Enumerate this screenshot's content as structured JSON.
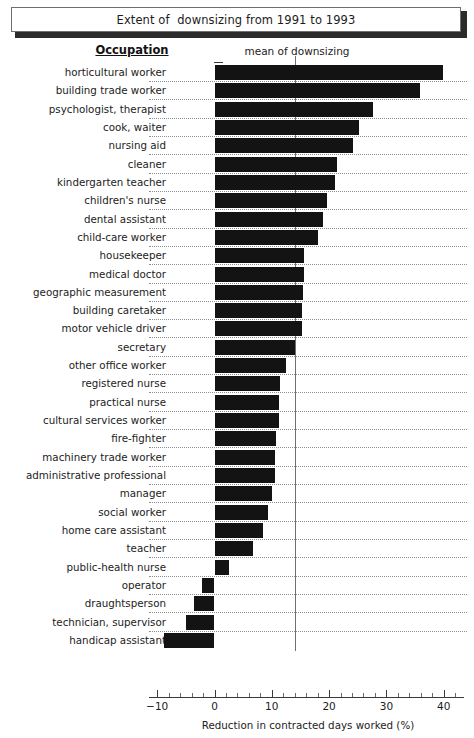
{
  "title": "Extent of  downsizing from 1991 to 1993",
  "headers": {
    "occupation": "Occupation",
    "mean_label": "mean of downsizing"
  },
  "axis": {
    "xlabel": "Reduction in contracted days worked (%)",
    "ticks": [
      "-10",
      "0",
      "10",
      "20",
      "30",
      "40"
    ],
    "tick_values": [
      -10,
      0,
      10,
      20,
      30,
      40
    ],
    "minor_step": 2,
    "xmin": -11.5,
    "xmax": 43.5
  },
  "mean_value": 14.1,
  "chart_data": {
    "type": "bar",
    "orientation": "horizontal",
    "title": "Extent of  downsizing from 1991 to 1993",
    "xlabel": "Reduction in contracted days worked (%)",
    "ylabel": "Occupation",
    "xlim": [
      -11.5,
      43.5
    ],
    "grid": true,
    "legend": null,
    "annotations": [
      {
        "text": "mean of downsizing",
        "type": "vline",
        "value": 14.1
      }
    ],
    "categories": [
      "horticultural worker",
      "building trade worker",
      "psychologist, therapist",
      "cook, waiter",
      "nursing aid",
      "cleaner",
      "kindergarten teacher",
      "children's nurse",
      "dental assistant",
      "child-care worker",
      "housekeeper",
      "medical doctor",
      "geographic measurement",
      "building caretaker",
      "motor vehicle driver",
      "secretary",
      "other office worker",
      "registered nurse",
      "practical nurse",
      "cultural services worker",
      "fire-fighter",
      "machinery trade worker",
      "administrative professional",
      "manager",
      "social worker",
      "home care assistant",
      "teacher",
      "public-health nurse",
      "operator",
      "draughtsperson",
      "technician,  supervisor",
      "handicap assistant"
    ],
    "values": [
      39.8,
      35.8,
      27.6,
      25.3,
      24.1,
      21.3,
      21.1,
      19.7,
      18.9,
      18.0,
      15.7,
      15.7,
      15.4,
      15.2,
      15.2,
      14.0,
      12.5,
      11.5,
      11.3,
      11.3,
      10.8,
      10.6,
      10.5,
      10.1,
      9.4,
      8.4,
      6.8,
      2.6,
      -2.1,
      -3.5,
      -5.0,
      -8.9
    ]
  },
  "colors": {
    "bar": "#131313",
    "grid": "#8e8e8e",
    "axis": "#3a3a3a",
    "mean_line": "#6f6f7a",
    "background": "#ffffff"
  }
}
